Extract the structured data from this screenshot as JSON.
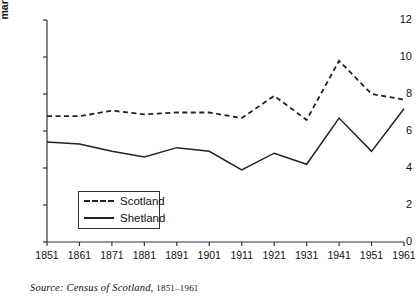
{
  "chart_data": {
    "type": "line",
    "title": "",
    "xlabel": "",
    "ylabel": "marriages per 1,000 pop",
    "x": [
      1851,
      1861,
      1871,
      1881,
      1891,
      1901,
      1911,
      1921,
      1931,
      1941,
      1951,
      1961
    ],
    "xticklabels": [
      "1851",
      "1861",
      "1871",
      "1881",
      "1891",
      "1901",
      "1911",
      "1921",
      "1931",
      "1941",
      "1951",
      "1961"
    ],
    "yticklabels": [
      "0",
      "2",
      "4",
      "6",
      "8",
      "10",
      "12"
    ],
    "yticks": [
      0,
      2,
      4,
      6,
      8,
      10,
      12
    ],
    "ylim": [
      0,
      12
    ],
    "xlim": [
      1851,
      1961
    ],
    "grid": false,
    "legend_position": "center-left",
    "series": [
      {
        "name": "Scotland",
        "style": "dashed",
        "color": "#222222",
        "values": [
          6.8,
          6.8,
          7.1,
          6.9,
          7.0,
          7.0,
          6.7,
          7.9,
          6.6,
          9.8,
          8.0,
          7.7
        ]
      },
      {
        "name": "Shetland",
        "style": "solid",
        "color": "#222222",
        "values": [
          5.4,
          5.3,
          4.9,
          4.6,
          5.1,
          4.9,
          3.9,
          4.8,
          4.2,
          6.7,
          4.9,
          7.2
        ]
      }
    ]
  },
  "legend": {
    "items": [
      {
        "label": "Scotland",
        "style": "dashed"
      },
      {
        "label": "Shetland",
        "style": "solid"
      }
    ]
  },
  "source": {
    "prefix": "Source:",
    "text": "Census of Scotland,",
    "years": "1851–1961"
  }
}
